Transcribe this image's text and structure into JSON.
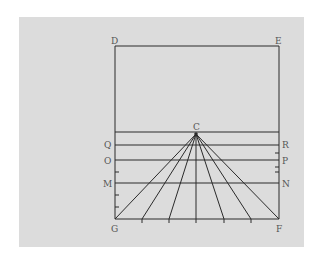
{
  "diagram": {
    "type": "perspective-construction",
    "background_color": "#dcdcdc",
    "line_color": "#2a2a2a",
    "labels": {
      "D": "D",
      "E": "E",
      "C": "C",
      "Q": "Q",
      "R": "R",
      "O": "O",
      "P": "P",
      "M": "M",
      "N": "N",
      "G": "G",
      "F": "F"
    },
    "points": {
      "D": [
        115,
        46
      ],
      "E": [
        279,
        46
      ],
      "G": [
        115,
        219
      ],
      "F": [
        279,
        219
      ],
      "C": [
        196,
        134
      ]
    },
    "horizontal_lines_y": [
      132,
      145,
      160,
      183,
      219
    ],
    "rays_from_C_to_x": [
      115,
      142,
      169,
      196,
      224,
      251,
      279
    ],
    "left_ticks_y": [
      172,
      195,
      207
    ],
    "right_ticks_y": [
      153,
      167,
      172
    ]
  }
}
